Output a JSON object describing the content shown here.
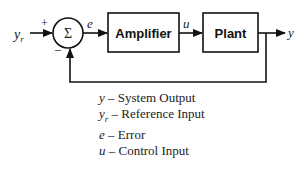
{
  "diagram": {
    "type": "feedback-control-loop",
    "summing_junction": {
      "symbol": "Σ",
      "plus_sign": "+",
      "minus_sign": "−"
    },
    "signals": {
      "reference": "y",
      "reference_sub": "r",
      "error": "e",
      "control": "u",
      "output": "y"
    },
    "blocks": [
      {
        "label": "Amplifier"
      },
      {
        "label": "Plant"
      }
    ]
  },
  "legend": [
    {
      "symbol": "y",
      "sub": "",
      "dash": " – ",
      "description": "System Output"
    },
    {
      "symbol": "y",
      "sub": "r",
      "dash": " – ",
      "description": "Reference Input"
    },
    {
      "symbol": "e",
      "sub": "",
      "dash": " – ",
      "description": "Error"
    },
    {
      "symbol": "u",
      "sub": "",
      "dash": " – ",
      "description": "Control Input"
    }
  ]
}
